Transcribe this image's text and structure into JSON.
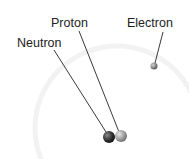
{
  "diagram": {
    "labels": {
      "neutron": "Neutron",
      "proton": "Proton",
      "electron": "Electron"
    },
    "colors": {
      "orbit": "#f3f3f3",
      "neutron": "#3a3a3a",
      "proton": "#9a9a9a",
      "electron": "#888888",
      "leader": "#222222"
    }
  }
}
